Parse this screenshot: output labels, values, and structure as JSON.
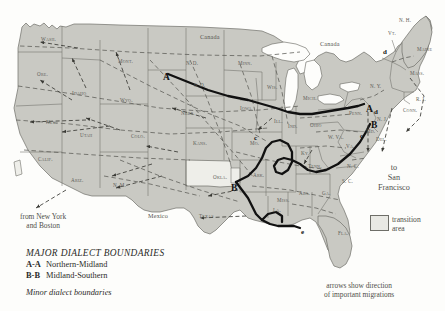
{
  "map": {
    "title": "Major dialect boundaries of the United States",
    "countries": [
      {
        "name": "Canada",
        "x": 200,
        "y": 33
      },
      {
        "name": "Canada",
        "x": 320,
        "y": 40
      },
      {
        "name": "Mexico",
        "x": 148,
        "y": 212
      }
    ],
    "states": [
      {
        "abbr": "Wash.",
        "x": 41,
        "y": 36
      },
      {
        "abbr": "Ore.",
        "x": 37,
        "y": 71
      },
      {
        "abbr": "Idaho",
        "x": 72,
        "y": 90
      },
      {
        "abbr": "Nev.",
        "x": 46,
        "y": 119
      },
      {
        "abbr": "Utah",
        "x": 80,
        "y": 132
      },
      {
        "abbr": "Calif.",
        "x": 38,
        "y": 156
      },
      {
        "abbr": "Ariz.",
        "x": 71,
        "y": 177
      },
      {
        "abbr": "N. M.",
        "x": 113,
        "y": 182
      },
      {
        "abbr": "Mont.",
        "x": 118,
        "y": 58
      },
      {
        "abbr": "Wyo.",
        "x": 120,
        "y": 97
      },
      {
        "abbr": "Colo.",
        "x": 131,
        "y": 133
      },
      {
        "abbr": "N. D.",
        "x": 186,
        "y": 60
      },
      {
        "abbr": "S. D.",
        "x": 194,
        "y": 82
      },
      {
        "abbr": "Nebr.",
        "x": 181,
        "y": 110
      },
      {
        "abbr": "Kans.",
        "x": 193,
        "y": 140
      },
      {
        "abbr": "Okla.",
        "x": 213,
        "y": 174
      },
      {
        "abbr": "Texas",
        "x": 199,
        "y": 213
      },
      {
        "abbr": "Minn.",
        "x": 238,
        "y": 60
      },
      {
        "abbr": "Iowa",
        "x": 240,
        "y": 105
      },
      {
        "abbr": "Mo.",
        "x": 250,
        "y": 140
      },
      {
        "abbr": "Ark.",
        "x": 253,
        "y": 172
      },
      {
        "abbr": "La.",
        "x": 273,
        "y": 207
      },
      {
        "abbr": "Wis.",
        "x": 267,
        "y": 84
      },
      {
        "abbr": "Ill.",
        "x": 274,
        "y": 118
      },
      {
        "abbr": "Miss.",
        "x": 277,
        "y": 197
      },
      {
        "abbr": "Mich.",
        "x": 303,
        "y": 95
      },
      {
        "abbr": "Ind.",
        "x": 288,
        "y": 123
      },
      {
        "abbr": "Ky.",
        "x": 301,
        "y": 150
      },
      {
        "abbr": "Tenn.",
        "x": 308,
        "y": 163
      },
      {
        "abbr": "Ala.",
        "x": 299,
        "y": 190
      },
      {
        "abbr": "Ohio",
        "x": 310,
        "y": 122
      },
      {
        "abbr": "Ga.",
        "x": 322,
        "y": 190
      },
      {
        "abbr": "Fla.",
        "x": 338,
        "y": 230
      },
      {
        "abbr": "W. Va.",
        "x": 328,
        "y": 134
      },
      {
        "abbr": "Va.",
        "x": 346,
        "y": 143
      },
      {
        "abbr": "N. C.",
        "x": 347,
        "y": 163
      },
      {
        "abbr": "S. C.",
        "x": 342,
        "y": 178
      },
      {
        "abbr": "Penn.",
        "x": 349,
        "y": 110
      },
      {
        "abbr": "N. Y.",
        "x": 370,
        "y": 83
      },
      {
        "abbr": "Del.",
        "x": 376,
        "y": 136
      },
      {
        "abbr": "Md.",
        "x": 366,
        "y": 128
      },
      {
        "abbr": "N. J.",
        "x": 377,
        "y": 116
      },
      {
        "abbr": "Conn.",
        "x": 403,
        "y": 107
      },
      {
        "abbr": "R. I.",
        "x": 416,
        "y": 96
      },
      {
        "abbr": "Mass.",
        "x": 410,
        "y": 70
      },
      {
        "abbr": "Vt.",
        "x": 388,
        "y": 30
      },
      {
        "abbr": "N. H.",
        "x": 399,
        "y": 17
      },
      {
        "abbr": "Maine",
        "x": 417,
        "y": 46
      }
    ],
    "markers": [
      {
        "label": "A",
        "x": 163,
        "y": 72,
        "size": "large"
      },
      {
        "label": "A",
        "x": 366,
        "y": 104,
        "size": "large"
      },
      {
        "label": "B",
        "x": 231,
        "y": 183,
        "size": "large"
      },
      {
        "label": "B",
        "x": 371,
        "y": 120,
        "size": "large"
      },
      {
        "label": "c",
        "x": 254,
        "y": 134,
        "size": "small"
      },
      {
        "label": "c",
        "x": 360,
        "y": 132,
        "size": "small"
      },
      {
        "label": "d",
        "x": 374,
        "y": 108,
        "size": "small"
      },
      {
        "label": "d",
        "x": 383,
        "y": 48,
        "size": "small"
      },
      {
        "label": "e",
        "x": 301,
        "y": 228,
        "size": "small"
      }
    ],
    "annotations": [
      {
        "name": "from-new-york-and-boston",
        "line1": "from New York",
        "line2": "and Boston",
        "x": 20,
        "y": 212
      },
      {
        "name": "to-san-francisco",
        "line1": "to",
        "line2": "San",
        "line3": "Francisco",
        "x": 378,
        "y": 163
      },
      {
        "name": "arrows-show-direction",
        "line1": "arrows show direction",
        "line2": "of important migrations",
        "x": 324,
        "y": 281
      }
    ]
  },
  "legend": {
    "title": "MAJOR DIALECT BOUNDARIES",
    "entries": [
      {
        "code": "A-A",
        "label": "Northern-Midland"
      },
      {
        "code": "B-B",
        "label": "Midland-Southern"
      }
    ],
    "minor_label": "Minor dialect boundaries",
    "transition_line1": "transition",
    "transition_line2": "area"
  },
  "colors": {
    "land": "#c9c9c3",
    "transition": "#eeeee9",
    "background": "#fdfdfb",
    "boundary_major": "#111111",
    "boundary_minor": "#5a5a54",
    "state_border": "#6e6e68",
    "text": "#4a4a46"
  }
}
